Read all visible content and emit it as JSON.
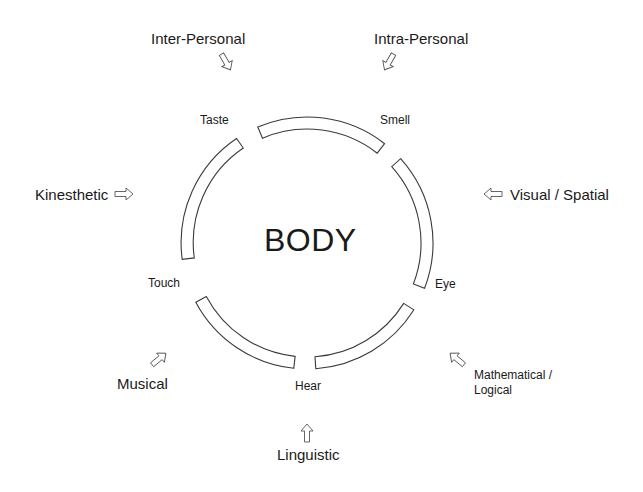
{
  "center_label": "BODY",
  "senses": [
    {
      "id": "taste",
      "label": "Taste"
    },
    {
      "id": "smell",
      "label": "Smell"
    },
    {
      "id": "eye",
      "label": "Eye"
    },
    {
      "id": "hear",
      "label": "Hear"
    },
    {
      "id": "touch",
      "label": "Touch"
    }
  ],
  "intelligences": [
    {
      "id": "inter-personal",
      "label": "Inter-Personal",
      "arrow": "down-right"
    },
    {
      "id": "intra-personal",
      "label": "Intra-Personal",
      "arrow": "down-left"
    },
    {
      "id": "kinesthetic",
      "label": "Kinesthetic",
      "arrow": "right"
    },
    {
      "id": "visual-spatial",
      "label": "Visual / Spatial",
      "arrow": "left"
    },
    {
      "id": "mathematical-logical",
      "label_line1": "Mathematical /",
      "label_line2": "Logical",
      "arrow": "up-left"
    },
    {
      "id": "musical",
      "label": "Musical",
      "arrow": "up-right"
    },
    {
      "id": "linguistic",
      "label": "Linguistic",
      "arrow": "up"
    }
  ],
  "colors": {
    "stroke": "#3a3a3a",
    "text": "#1a1a1a",
    "background": "#ffffff"
  }
}
